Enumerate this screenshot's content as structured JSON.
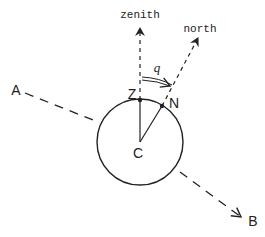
{
  "diagram": {
    "labels": {
      "zenith": "zenith",
      "north": "north",
      "angle": "q",
      "point_A": "A",
      "point_B": "B",
      "point_Z": "Z",
      "point_N": "N",
      "point_C": "C"
    },
    "colors": {
      "stroke": "#222222",
      "background": "#ffffff"
    }
  }
}
